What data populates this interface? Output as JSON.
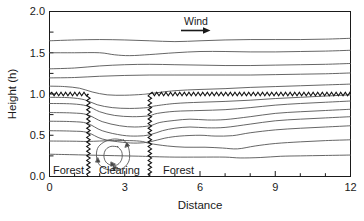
{
  "chart_data": {
    "type": "line",
    "title": "",
    "xlabel": "Distance",
    "ylabel": "Height (h)",
    "xlim": [
      0,
      12
    ],
    "ylim": [
      0,
      2.0
    ],
    "x_ticks": [
      "0",
      "3",
      "6",
      "9",
      "12"
    ],
    "x_tick_values": [
      0,
      3,
      6,
      9,
      12
    ],
    "x_minor_interval": 1,
    "y_ticks": [
      "0.0",
      "0.5",
      "1.0",
      "1.5",
      "2.0"
    ],
    "y_tick_values": [
      0.0,
      0.5,
      1.0,
      1.5,
      2.0
    ],
    "y_minor_interval": 0.25,
    "grid": false,
    "legend": "none",
    "annotations": [
      {
        "name": "wind-arrow",
        "text": "Wind",
        "x": 6.35,
        "y": 1.85,
        "direction": "right"
      },
      {
        "name": "forest-left",
        "text": "Forest",
        "x": 0.55,
        "y": 0.12
      },
      {
        "name": "clearing",
        "text": "Clearing",
        "x": 2.0,
        "y": 0.12
      },
      {
        "name": "forest-right",
        "text": "Forest",
        "x": 4.55,
        "y": 0.12
      }
    ],
    "canopy": {
      "height": 1.0,
      "label": "forest canopy (sawtooth)",
      "segments": [
        {
          "name": "left-canopy-top",
          "x_start": 0.0,
          "x_end": 1.55
        },
        {
          "name": "right-canopy-top",
          "x_start": 4.0,
          "x_end": 12.0
        },
        {
          "name": "left-canopy-edge",
          "x": 1.55,
          "y_start": 0.0,
          "y_end": 1.0
        },
        {
          "name": "right-canopy-edge",
          "x": 4.0,
          "y_start": 0.0,
          "y_end": 1.0
        }
      ]
    },
    "clearing_extent": {
      "x_start": 1.55,
      "x_end": 4.0
    },
    "series": [
      {
        "name": "streamline-1",
        "points": [
          [
            0,
            1.645
          ],
          [
            1.0,
            1.655
          ],
          [
            2.0,
            1.66
          ],
          [
            3.0,
            1.655
          ],
          [
            4.0,
            1.645
          ],
          [
            5.0,
            1.635
          ],
          [
            6.0,
            1.645
          ],
          [
            7.0,
            1.655
          ],
          [
            8.0,
            1.66
          ],
          [
            9.0,
            1.66
          ],
          [
            10.0,
            1.66
          ],
          [
            11.0,
            1.665
          ],
          [
            12.0,
            1.675
          ]
        ]
      },
      {
        "name": "streamline-2",
        "points": [
          [
            0,
            1.5
          ],
          [
            1.0,
            1.5
          ],
          [
            2.0,
            1.5
          ],
          [
            2.6,
            1.475
          ],
          [
            3.2,
            1.465
          ],
          [
            4.0,
            1.478
          ],
          [
            5.0,
            1.5
          ],
          [
            6.0,
            1.515
          ],
          [
            7.0,
            1.515
          ],
          [
            8.0,
            1.51
          ],
          [
            9.0,
            1.51
          ],
          [
            10.0,
            1.515
          ],
          [
            11.0,
            1.52
          ],
          [
            12.0,
            1.53
          ]
        ]
      },
      {
        "name": "streamline-3",
        "points": [
          [
            0,
            1.305
          ],
          [
            1.0,
            1.315
          ],
          [
            2.0,
            1.34
          ],
          [
            3.0,
            1.355
          ],
          [
            4.0,
            1.36
          ],
          [
            5.0,
            1.355
          ],
          [
            6.0,
            1.35
          ],
          [
            7.0,
            1.345
          ],
          [
            8.0,
            1.345
          ],
          [
            9.0,
            1.35
          ],
          [
            10.0,
            1.355
          ],
          [
            11.0,
            1.36
          ],
          [
            12.0,
            1.37
          ]
        ]
      },
      {
        "name": "streamline-4",
        "points": [
          [
            0,
            1.195
          ],
          [
            1.0,
            1.2
          ],
          [
            2.0,
            1.215
          ],
          [
            3.0,
            1.225
          ],
          [
            4.0,
            1.23
          ],
          [
            5.0,
            1.23
          ],
          [
            6.0,
            1.23
          ],
          [
            7.0,
            1.23
          ],
          [
            8.0,
            1.23
          ],
          [
            9.0,
            1.235
          ],
          [
            10.0,
            1.24
          ],
          [
            11.0,
            1.245
          ],
          [
            12.0,
            1.255
          ]
        ]
      },
      {
        "name": "streamline-5",
        "points": [
          [
            0,
            1.095
          ],
          [
            0.6,
            1.09
          ],
          [
            1.2,
            1.07
          ],
          [
            1.7,
            1.025
          ],
          [
            2.3,
            0.99
          ],
          [
            3.0,
            0.985
          ],
          [
            3.7,
            0.995
          ],
          [
            4.0,
            1.005
          ],
          [
            5.0,
            1.04
          ],
          [
            6.0,
            1.055
          ],
          [
            7.0,
            1.065
          ],
          [
            8.0,
            1.08
          ],
          [
            9.0,
            1.09
          ],
          [
            10.0,
            1.1
          ],
          [
            11.0,
            1.11
          ],
          [
            12.0,
            1.12
          ]
        ]
      },
      {
        "name": "streamline-6",
        "points": [
          [
            0,
            0.96
          ],
          [
            0.8,
            0.955
          ],
          [
            1.4,
            0.93
          ],
          [
            1.9,
            0.87
          ],
          [
            2.5,
            0.835
          ],
          [
            3.2,
            0.825
          ],
          [
            3.9,
            0.835
          ],
          [
            4.2,
            0.855
          ],
          [
            5.0,
            0.885
          ],
          [
            6.0,
            0.9
          ],
          [
            7.0,
            0.91
          ],
          [
            8.0,
            0.925
          ],
          [
            9.0,
            0.945
          ],
          [
            10.0,
            0.96
          ],
          [
            11.0,
            0.975
          ],
          [
            12.0,
            0.99
          ]
        ]
      },
      {
        "name": "streamline-7",
        "points": [
          [
            0,
            0.885
          ],
          [
            0.9,
            0.88
          ],
          [
            1.5,
            0.855
          ],
          [
            2.0,
            0.785
          ],
          [
            2.6,
            0.74
          ],
          [
            3.3,
            0.725
          ],
          [
            3.95,
            0.735
          ],
          [
            4.3,
            0.765
          ],
          [
            5.0,
            0.79
          ],
          [
            6.0,
            0.8
          ],
          [
            7.0,
            0.81
          ],
          [
            8.0,
            0.835
          ],
          [
            9.0,
            0.865
          ],
          [
            10.0,
            0.885
          ],
          [
            11.0,
            0.9
          ],
          [
            12.0,
            0.915
          ]
        ]
      },
      {
        "name": "streamline-8",
        "points": [
          [
            0,
            0.775
          ],
          [
            0.9,
            0.77
          ],
          [
            1.5,
            0.75
          ],
          [
            2.1,
            0.665
          ],
          [
            2.8,
            0.615
          ],
          [
            3.4,
            0.6
          ],
          [
            4.0,
            0.615
          ],
          [
            4.4,
            0.655
          ],
          [
            5.0,
            0.68
          ],
          [
            5.6,
            0.695
          ],
          [
            6.3,
            0.685
          ],
          [
            7.0,
            0.69
          ],
          [
            8.0,
            0.725
          ],
          [
            9.0,
            0.765
          ],
          [
            10.0,
            0.785
          ],
          [
            11.0,
            0.8
          ],
          [
            12.0,
            0.815
          ]
        ]
      },
      {
        "name": "streamline-9",
        "points": [
          [
            0,
            0.67
          ],
          [
            0.9,
            0.665
          ],
          [
            1.5,
            0.645
          ],
          [
            2.1,
            0.555
          ],
          [
            2.9,
            0.5
          ],
          [
            3.5,
            0.49
          ],
          [
            4.0,
            0.505
          ],
          [
            4.5,
            0.555
          ],
          [
            5.0,
            0.585
          ],
          [
            5.6,
            0.6
          ],
          [
            6.3,
            0.59
          ],
          [
            7.0,
            0.595
          ],
          [
            8.0,
            0.635
          ],
          [
            9.0,
            0.675
          ],
          [
            10.0,
            0.695
          ],
          [
            11.0,
            0.71
          ],
          [
            12.0,
            0.725
          ]
        ]
      },
      {
        "name": "streamline-10",
        "points": [
          [
            0,
            0.555
          ],
          [
            0.9,
            0.55
          ],
          [
            1.5,
            0.535
          ],
          [
            2.1,
            0.455
          ],
          [
            2.9,
            0.415
          ],
          [
            3.5,
            0.405
          ],
          [
            4.0,
            0.42
          ],
          [
            4.6,
            0.465
          ],
          [
            5.2,
            0.49
          ],
          [
            6.0,
            0.5
          ],
          [
            6.6,
            0.49
          ],
          [
            7.3,
            0.495
          ],
          [
            8.0,
            0.53
          ],
          [
            9.0,
            0.565
          ],
          [
            10.0,
            0.585
          ],
          [
            11.0,
            0.6
          ],
          [
            12.0,
            0.615
          ]
        ]
      },
      {
        "name": "streamline-11",
        "points": [
          [
            0,
            0.43
          ],
          [
            0.9,
            0.428
          ],
          [
            1.5,
            0.425
          ],
          [
            2.0,
            0.43
          ],
          [
            2.6,
            0.435
          ],
          [
            3.2,
            0.435
          ],
          [
            3.7,
            0.425
          ],
          [
            4.0,
            0.4
          ],
          [
            4.7,
            0.37
          ],
          [
            5.4,
            0.355
          ],
          [
            6.2,
            0.355
          ],
          [
            6.9,
            0.345
          ],
          [
            7.5,
            0.335
          ],
          [
            8.2,
            0.37
          ],
          [
            9.0,
            0.4
          ],
          [
            10.0,
            0.42
          ],
          [
            11.0,
            0.435
          ],
          [
            12.0,
            0.445
          ]
        ]
      },
      {
        "name": "streamline-12",
        "points": [
          [
            0,
            0.27
          ],
          [
            0.8,
            0.265
          ],
          [
            1.5,
            0.26
          ],
          [
            2.2,
            0.255
          ],
          [
            3.0,
            0.25
          ],
          [
            3.7,
            0.245
          ],
          [
            4.2,
            0.24
          ],
          [
            5.0,
            0.235
          ],
          [
            6.0,
            0.235
          ],
          [
            7.0,
            0.235
          ],
          [
            7.6,
            0.225
          ],
          [
            8.4,
            0.23
          ],
          [
            9.2,
            0.245
          ],
          [
            10.0,
            0.25
          ],
          [
            11.0,
            0.255
          ],
          [
            12.0,
            0.26
          ]
        ]
      }
    ],
    "eddy": {
      "name": "recirculation-eddy",
      "center": [
        2.55,
        0.27
      ],
      "outer_loop": [
        [
          2.95,
          0.44
        ],
        [
          2.6,
          0.455
        ],
        [
          2.25,
          0.43
        ],
        [
          1.95,
          0.36
        ],
        [
          1.87,
          0.26
        ],
        [
          1.95,
          0.16
        ],
        [
          2.2,
          0.095
        ],
        [
          2.6,
          0.075
        ],
        [
          2.95,
          0.105
        ],
        [
          3.17,
          0.19
        ],
        [
          3.18,
          0.31
        ],
        [
          3.08,
          0.4
        ],
        [
          2.95,
          0.44
        ]
      ],
      "inner_loop": [
        [
          2.72,
          0.36
        ],
        [
          2.45,
          0.365
        ],
        [
          2.24,
          0.325
        ],
        [
          2.17,
          0.25
        ],
        [
          2.25,
          0.175
        ],
        [
          2.47,
          0.135
        ],
        [
          2.72,
          0.145
        ],
        [
          2.88,
          0.21
        ],
        [
          2.88,
          0.3
        ],
        [
          2.72,
          0.36
        ]
      ],
      "arrow_marks": [
        {
          "x": 3.07,
          "y": 0.375,
          "dir": "down-left"
        },
        {
          "x": 1.93,
          "y": 0.2,
          "dir": "up"
        },
        {
          "x": 2.62,
          "y": 0.105,
          "dir": "right"
        },
        {
          "x": 2.53,
          "y": 0.148,
          "dir": "right"
        }
      ]
    },
    "colors": {
      "streamline": "#555555",
      "axis": "#1a1a1a",
      "canopy": "#111111",
      "background": "#ffffff",
      "text": "#1a1a1a"
    }
  }
}
